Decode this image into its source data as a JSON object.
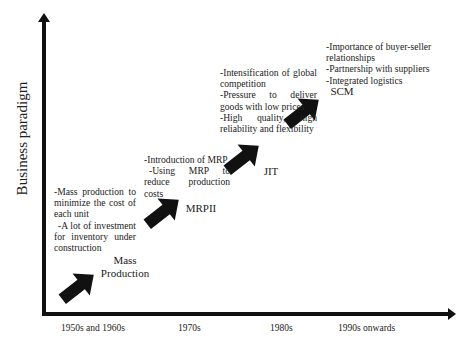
{
  "diagram": {
    "y_axis_label": "Business paradigm",
    "x_axis_ticks": [
      "1950s and 1960s",
      "1970s",
      "1980s",
      "1990s onwards"
    ],
    "stages": [
      {
        "name_line1": "Mass",
        "name_line2": "Production",
        "notes": [
          "-Mass production to minimize the cost of each unit",
          "-A lot of investment for inventory under construction"
        ]
      },
      {
        "name_line1": "MRPII",
        "notes": [
          "-Introduction of MRP",
          "-Using MRP to reduce production costs"
        ]
      },
      {
        "name_line1": "JIT",
        "notes": [
          "-Intensification of global competition",
          "-Pressure to deliver goods with low prices",
          "-High quality, high reliability and flexibility"
        ]
      },
      {
        "name_line1": "SCM",
        "notes": [
          "-Importance of buyer-seller relationships",
          "-Partnership with suppliers",
          "-Integrated logistics"
        ]
      }
    ],
    "colors": {
      "axis": "#111111",
      "arrow": "#111111",
      "text": "#222222",
      "background": "#ffffff"
    }
  }
}
